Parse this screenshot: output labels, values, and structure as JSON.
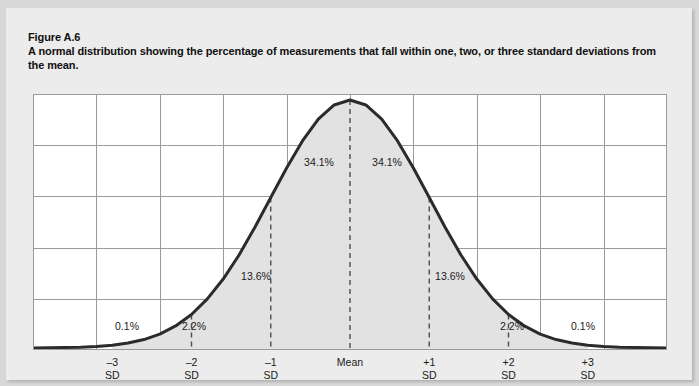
{
  "figure": {
    "number": "Figure A.6",
    "caption": "A normal distribution showing the percentage of measurements that fall within one, two, or three standard deviations from the mean."
  },
  "colors": {
    "page_background": "#d8d8d8",
    "panel_background": "#ececec",
    "plot_background": "#ffffff",
    "curve": "#2b2b2b",
    "fill_under_curve": "#e2e2e2",
    "gridline": "#9a9a9a",
    "dashed_divider": "#4d4d4d",
    "text": "#101010"
  },
  "chart_data": {
    "type": "area",
    "title": "A normal distribution showing the percentage of measurements that fall within one, two, or three standard deviations from the mean.",
    "xlabel": "",
    "ylabel": "",
    "xlim": [
      -4,
      4
    ],
    "ylim": [
      0,
      1
    ],
    "grid": true,
    "legend": null,
    "distribution": "normal",
    "mean": 0,
    "sd": 1,
    "x_ticks": [
      {
        "value": -3,
        "label": "–3",
        "sublabel": "SD"
      },
      {
        "value": -2,
        "label": "–2",
        "sublabel": "SD"
      },
      {
        "value": -1,
        "label": "–1",
        "sublabel": "SD"
      },
      {
        "value": 0,
        "label": "Mean",
        "sublabel": ""
      },
      {
        "value": 1,
        "label": "+1",
        "sublabel": "SD"
      },
      {
        "value": 2,
        "label": "+2",
        "sublabel": "SD"
      },
      {
        "value": 3,
        "label": "+3",
        "sublabel": "SD"
      }
    ],
    "dashed_dividers_at": [
      -2,
      -1,
      0,
      1,
      2
    ],
    "grid_columns": 10,
    "grid_rows": 5,
    "region_annotations": [
      {
        "label": "0.1%",
        "value": 0.1,
        "from_sd": -4,
        "to_sd": -3,
        "x_px": 121,
        "y_px": 318
      },
      {
        "label": "2.2%",
        "value": 2.2,
        "from_sd": -3,
        "to_sd": -2,
        "x_px": 188,
        "y_px": 318
      },
      {
        "label": "13.6%",
        "value": 13.6,
        "from_sd": -2,
        "to_sd": -1,
        "x_px": 250,
        "y_px": 268
      },
      {
        "label": "34.1%",
        "value": 34.1,
        "from_sd": -1,
        "to_sd": 0,
        "x_px": 313,
        "y_px": 154
      },
      {
        "label": "34.1%",
        "value": 34.1,
        "from_sd": 0,
        "to_sd": 1,
        "x_px": 381,
        "y_px": 154
      },
      {
        "label": "13.6%",
        "value": 13.6,
        "from_sd": 1,
        "to_sd": 2,
        "x_px": 444,
        "y_px": 268
      },
      {
        "label": "2.2%",
        "value": 2.2,
        "from_sd": 2,
        "to_sd": 3,
        "x_px": 506,
        "y_px": 318
      },
      {
        "label": "0.1%",
        "value": 0.1,
        "from_sd": 3,
        "to_sd": 4,
        "x_px": 577,
        "y_px": 318
      }
    ],
    "series": [
      {
        "name": "Normal density",
        "x": [
          -4.0,
          -3.8,
          -3.6,
          -3.4,
          -3.2,
          -3.0,
          -2.8,
          -2.6,
          -2.4,
          -2.2,
          -2.0,
          -1.8,
          -1.6,
          -1.4,
          -1.2,
          -1.0,
          -0.8,
          -0.6,
          -0.4,
          -0.2,
          0.0,
          0.2,
          0.4,
          0.6,
          0.8,
          1.0,
          1.2,
          1.4,
          1.6,
          1.8,
          2.0,
          2.2,
          2.4,
          2.6,
          2.8,
          3.0,
          3.2,
          3.4,
          3.6,
          3.8,
          4.0
        ],
        "y": [
          0.0,
          0.001,
          0.002,
          0.003,
          0.006,
          0.011,
          0.02,
          0.034,
          0.056,
          0.089,
          0.135,
          0.198,
          0.278,
          0.375,
          0.487,
          0.607,
          0.726,
          0.835,
          0.923,
          0.98,
          1.0,
          0.98,
          0.923,
          0.835,
          0.726,
          0.607,
          0.487,
          0.375,
          0.278,
          0.198,
          0.135,
          0.089,
          0.056,
          0.034,
          0.02,
          0.011,
          0.006,
          0.003,
          0.002,
          0.001,
          0.0
        ]
      }
    ]
  }
}
